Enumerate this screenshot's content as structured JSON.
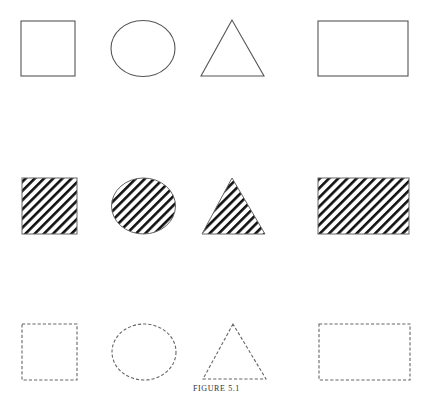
{
  "figure": {
    "caption": "FIGURE 5.1",
    "stroke_color": "#555555",
    "hatch_color": "#111111",
    "rows": [
      {
        "name": "outlined",
        "style": "solid-outline",
        "shapes": [
          "square",
          "circle",
          "triangle",
          "rectangle"
        ]
      },
      {
        "name": "hatched",
        "style": "diagonal-hatch-fill",
        "shapes": [
          "square",
          "circle",
          "triangle",
          "rectangle"
        ]
      },
      {
        "name": "dashed",
        "style": "dashed-outline",
        "shapes": [
          "square",
          "circle",
          "triangle",
          "rectangle"
        ]
      }
    ]
  }
}
